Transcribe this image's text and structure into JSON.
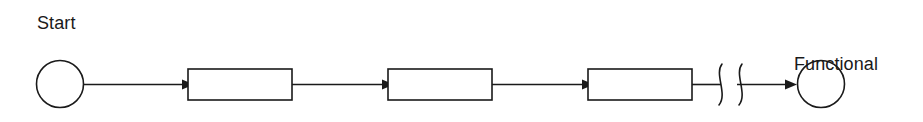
{
  "diagram": {
    "type": "flow-diagram",
    "title": "",
    "background_color": "#ffffff",
    "stroke_color": "#1a1a1a",
    "width": 923,
    "height": 122,
    "labels": {
      "start": "Start",
      "end_line1": "Functional",
      "end_line2": "solution"
    },
    "nodes": [
      {
        "id": "start-node",
        "kind": "circle",
        "label": "Start",
        "cx": 60,
        "cy": 84,
        "r": 23.5,
        "text": ""
      },
      {
        "id": "step-1",
        "kind": "rectangle",
        "label": "",
        "x": 188,
        "y": 69,
        "width": 104,
        "height": 31,
        "text": ""
      },
      {
        "id": "step-2",
        "kind": "rectangle",
        "label": "",
        "x": 388,
        "y": 69,
        "width": 104,
        "height": 31,
        "text": ""
      },
      {
        "id": "step-3",
        "kind": "rectangle",
        "label": "",
        "x": 588,
        "y": 69,
        "width": 104,
        "height": 31,
        "text": ""
      },
      {
        "id": "end-node",
        "kind": "circle",
        "label": "Functional solution",
        "cx": 821,
        "cy": 84,
        "r": 23.5,
        "text": ""
      }
    ],
    "connectors": [
      {
        "id": "conn-1",
        "from": "start-node",
        "to": "step-1",
        "x1": 84,
        "x2": 188,
        "y": 84,
        "arrow": true
      },
      {
        "id": "conn-2",
        "from": "step-1",
        "to": "step-2",
        "x1": 292,
        "x2": 388,
        "y": 84,
        "arrow": true
      },
      {
        "id": "conn-3",
        "from": "step-2",
        "to": "step-3",
        "x1": 492,
        "x2": 588,
        "y": 84,
        "arrow": true
      },
      {
        "id": "conn-4",
        "from": "step-3",
        "to": "break-symbol",
        "x1": 692,
        "x2": 722,
        "y": 84,
        "arrow": false
      },
      {
        "id": "conn-5",
        "from": "break-symbol",
        "to": "end-node",
        "x1": 736,
        "x2": 797,
        "y": 84,
        "arrow": true
      }
    ],
    "break_symbol": {
      "id": "break-symbol",
      "kind": "double-squiggle-break",
      "meaning": "continuation / omitted steps",
      "curve_1_x": 719,
      "curve_2_x": 739,
      "top_y": 64,
      "bottom_y": 105
    }
  }
}
